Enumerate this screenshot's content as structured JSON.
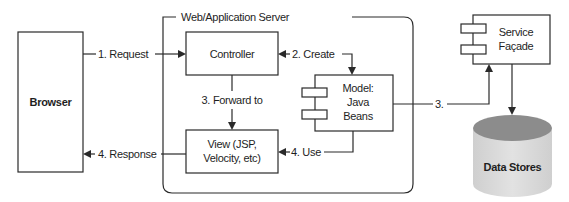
{
  "diagram": {
    "container": {
      "title": "Web/Application Server"
    },
    "nodes": {
      "browser": {
        "label": "Browser"
      },
      "controller": {
        "label": "Controller"
      },
      "model": {
        "lines": [
          "Model:",
          "Java",
          "Beans"
        ]
      },
      "view": {
        "lines": [
          "View (JSP,",
          "Velocity, etc)"
        ]
      },
      "service_facade": {
        "lines": [
          "Service",
          "Façade"
        ]
      },
      "data_stores": {
        "label": "Data Stores"
      }
    },
    "edges": {
      "request": "1. Request",
      "create": "2. Create",
      "forward": "3. Forward to",
      "to_service": "3.",
      "use": "4. Use",
      "response": "4. Response"
    },
    "colors": {
      "stroke": "#2a2a2a",
      "cylinder_top": "#8c8c8c",
      "cylinder_body": "#d9d9d9"
    }
  }
}
